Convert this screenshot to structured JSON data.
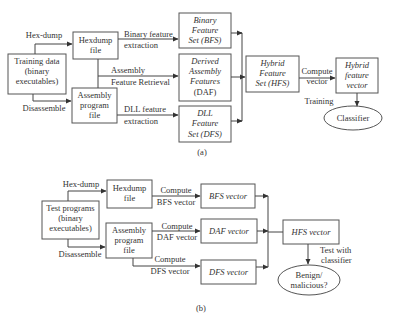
{
  "diagram_a": {
    "caption": "(a)",
    "training_data": [
      "Training data",
      "(binary",
      "executables)"
    ],
    "hexdump_file": [
      "Hexdump",
      "file"
    ],
    "assembly_file": [
      "Assembly",
      "program",
      "file"
    ],
    "bfs": [
      "Binary",
      "Feature",
      "Set (BFS)"
    ],
    "daf": [
      "Derived",
      "Assembly",
      "Features",
      "(DAF)"
    ],
    "dfs": [
      "DLL",
      "Feature",
      "Set (DFS)"
    ],
    "hfs": [
      "Hybrid",
      "Feature",
      "Set (HFS)"
    ],
    "hybrid_vector": [
      "Hybrid",
      "feature",
      "vector"
    ],
    "classifier": "Classifier",
    "labels": {
      "hexdump": "Hex-dump",
      "disassemble": "Disassemble",
      "binary_feature": [
        "Binary feature",
        "extraction"
      ],
      "assembly_feature": [
        "Assembly",
        "Feature Retrieval"
      ],
      "dll_feature": [
        "DLL feature",
        "extraction"
      ],
      "compute_vector": [
        "Compute",
        "vector"
      ],
      "training": "Training"
    }
  },
  "diagram_b": {
    "caption": "(b)",
    "test_programs": [
      "Test programs",
      "(binary",
      "executables)"
    ],
    "hexdump_file": [
      "Hexdump",
      "file"
    ],
    "assembly_file": [
      "Assembly",
      "program",
      "file"
    ],
    "bfs_vector": "BFS vector",
    "daf_vector": "DAF vector",
    "dfs_vector": "DFS vector",
    "hfs_vector": "HFS vector",
    "result": [
      "Benign/",
      "malicious?"
    ],
    "labels": {
      "hexdump": "Hex-dump",
      "disassemble": "Disassemble",
      "compute_bfs": [
        "Compute",
        "BFS vector"
      ],
      "compute_daf": [
        "Compute",
        "DAF vector"
      ],
      "compute_dfs": [
        "Compute",
        "DFS vector"
      ],
      "test_with": [
        "Test with",
        "classifier"
      ]
    }
  }
}
